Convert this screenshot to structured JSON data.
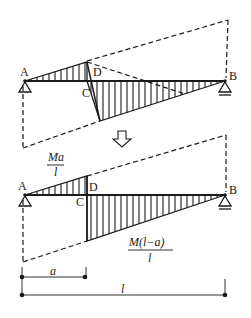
{
  "diagram": {
    "top": {
      "labels": {
        "A": "A",
        "B": "B",
        "C": "C",
        "D": "D"
      }
    },
    "arrow": {
      "icon": "down-arrow-icon"
    },
    "bottom": {
      "labels": {
        "A": "A",
        "B": "B",
        "C": "C",
        "D": "D"
      },
      "left_value": {
        "numerator": "Ma",
        "denominator": "l"
      },
      "right_value": {
        "numerator": "M(l−a)",
        "denominator": "l"
      }
    },
    "dimensions": {
      "a": "a",
      "l": "l"
    },
    "colors": {
      "ink": "#1a1a1a",
      "background": "#ffffff"
    }
  }
}
